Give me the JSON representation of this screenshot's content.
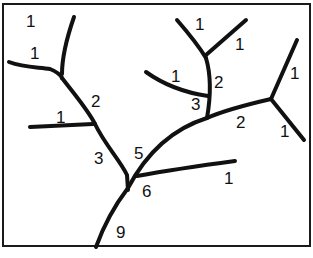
{
  "diagram": {
    "type": "stream-order-tree",
    "labels": [
      {
        "id": "l1",
        "text": "1",
        "x": 26,
        "y": 27
      },
      {
        "id": "l2",
        "text": "1",
        "x": 30,
        "y": 59
      },
      {
        "id": "l3",
        "text": "2",
        "x": 91,
        "y": 107
      },
      {
        "id": "l4",
        "text": "1",
        "x": 56,
        "y": 123
      },
      {
        "id": "l5",
        "text": "3",
        "x": 94,
        "y": 164
      },
      {
        "id": "l6",
        "text": "5",
        "x": 134,
        "y": 159
      },
      {
        "id": "l7",
        "text": "6",
        "x": 142,
        "y": 197
      },
      {
        "id": "l8",
        "text": "1",
        "x": 224,
        "y": 184
      },
      {
        "id": "l9",
        "text": "9",
        "x": 116,
        "y": 238
      },
      {
        "id": "l10",
        "text": "1",
        "x": 195,
        "y": 30
      },
      {
        "id": "l11",
        "text": "1",
        "x": 235,
        "y": 50
      },
      {
        "id": "l12",
        "text": "1",
        "x": 171,
        "y": 82
      },
      {
        "id": "l13",
        "text": "2",
        "x": 214,
        "y": 88
      },
      {
        "id": "l14",
        "text": "3",
        "x": 191,
        "y": 110
      },
      {
        "id": "l15",
        "text": "2",
        "x": 236,
        "y": 128
      },
      {
        "id": "l16",
        "text": "1",
        "x": 290,
        "y": 79
      },
      {
        "id": "l17",
        "text": "1",
        "x": 280,
        "y": 137
      }
    ],
    "segments": [
      {
        "id": "s1",
        "d": "M74 17 C66 40 62 58 62 74"
      },
      {
        "id": "s2",
        "d": "M9 62 C25 68 40 67 50 69 C55 71 60 74 62 78"
      },
      {
        "id": "s3",
        "d": "M62 78 C75 95 88 110 95 124"
      },
      {
        "id": "s4",
        "d": "M30 127 L93 124"
      },
      {
        "id": "s5",
        "d": "M95 124 C105 145 120 160 127 175 L128 190"
      },
      {
        "id": "s6",
        "d": "M177 20 C190 35 200 48 206 58"
      },
      {
        "id": "s7",
        "d": "M246 20 L206 55"
      },
      {
        "id": "s8",
        "d": "M206 58 C211 75 211 95 207 118"
      },
      {
        "id": "s9",
        "d": "M146 72 C160 82 180 92 208 96"
      },
      {
        "id": "s10",
        "d": "M207 118 C225 110 245 105 271 99"
      },
      {
        "id": "s11",
        "d": "M297 40 L271 99"
      },
      {
        "id": "s12",
        "d": "M271 99 L304 140"
      },
      {
        "id": "s13",
        "d": "M207 118 C175 128 148 150 128 188"
      },
      {
        "id": "s14",
        "d": "M137 176 C170 170 205 165 235 161"
      },
      {
        "id": "s15",
        "d": "M128 188 C115 205 105 222 96 247"
      }
    ]
  }
}
